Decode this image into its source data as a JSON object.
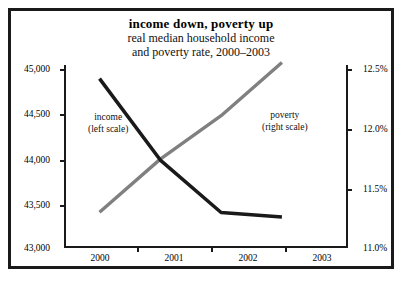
{
  "figure": {
    "title": "income down, poverty up",
    "subtitle_line1": "real median household income",
    "subtitle_line2": "and poverty rate, 2000–2003"
  },
  "annotations": {
    "income": {
      "line1": "income",
      "line2": "(left scale)"
    },
    "poverty": {
      "line1": "poverty",
      "line2": "(right scale)"
    }
  },
  "axes": {
    "left_ticks": [
      "45,000",
      "44,500",
      "44,000",
      "43,500",
      "43,000"
    ],
    "right_ticks": [
      "12.5%",
      "12.0%",
      "11.5%",
      "11.0%"
    ],
    "x_ticks": [
      "2000",
      "2001",
      "2002",
      "2003"
    ]
  },
  "colors": {
    "income_line": "#1a1a1a",
    "poverty_line": "#808080",
    "frame": "#1a1a1a",
    "background": "#ffffff"
  },
  "chart_data": {
    "type": "line",
    "title": "income down, poverty up",
    "subtitle": "real median household income and poverty rate, 2000–2003",
    "xlabel": "",
    "ylabel": "real median household income (dollars)",
    "y2label": "poverty rate (percent)",
    "categories": [
      "2000",
      "2001",
      "2002",
      "2003"
    ],
    "x": [
      2000,
      2001,
      2002,
      2003
    ],
    "ylim": [
      43000,
      45000
    ],
    "y2lim": [
      11.0,
      12.5
    ],
    "yticks": [
      43000,
      43500,
      44000,
      44500,
      45000
    ],
    "y2ticks": [
      11.0,
      11.5,
      12.0,
      12.5
    ],
    "grid": false,
    "legend": "inline annotations",
    "series": [
      {
        "name": "income",
        "axis": "left",
        "scale_label": "(left scale)",
        "color": "#1a1a1a",
        "values": [
          44850,
          43950,
          43370,
          43320
        ]
      },
      {
        "name": "poverty",
        "axis": "right",
        "scale_label": "(right scale)",
        "color": "#808080",
        "values": [
          11.28,
          11.72,
          12.08,
          12.52
        ]
      }
    ]
  }
}
